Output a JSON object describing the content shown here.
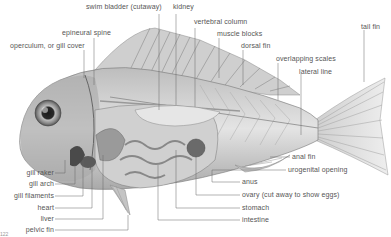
{
  "diagram": {
    "labels": {
      "swim_bladder": "swim bladder (cutaway)",
      "kidney": "kidney",
      "vertebral_column": "vertebral column",
      "epineural_spine": "epineural spine",
      "muscle_blocks": "muscle blocks",
      "dorsal_fin": "dorsal fin",
      "operculum": "operculum, or gill cover",
      "overlapping_scales": "overlapping scales",
      "lateral_line": "lateral line",
      "tail_fin": "tail fin",
      "gill_raker": "gill raker",
      "gill_arch": "gill arch",
      "gill_filaments": "gill filaments",
      "heart": "heart",
      "liver": "liver",
      "pelvic_fin": "pelvic fin",
      "anal_fin": "anal fin",
      "urogenital_opening": "urogenital opening",
      "anus": "anus",
      "ovary": "ovary (cut away to show eggs)",
      "stomach": "stomach",
      "intestine": "intestine"
    },
    "page_number": "122",
    "colors": {
      "label_text": "#555555",
      "leader_line": "#666666",
      "fish_light": "#d8d8d8",
      "fish_dark": "#6a6a6a"
    }
  }
}
